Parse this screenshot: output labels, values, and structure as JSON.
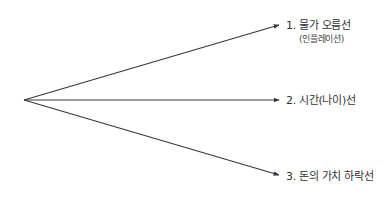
{
  "diagram": {
    "origin": {
      "x": 24,
      "y": 100
    },
    "line_color": "#3a3a3a",
    "branches": [
      {
        "number": "1.",
        "label": "1. 물가 오름선",
        "sublabel": "(인플레이션)",
        "tip": {
          "x": 279,
          "y": 25
        }
      },
      {
        "number": "2.",
        "label": "2. 시간(나이)선",
        "tip": {
          "x": 279,
          "y": 100
        }
      },
      {
        "number": "3.",
        "label": "3. 돈의 가치 하락선",
        "tip": {
          "x": 279,
          "y": 175
        }
      }
    ]
  }
}
